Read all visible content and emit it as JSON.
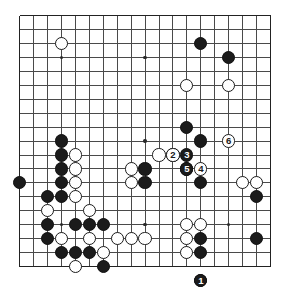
{
  "board": {
    "title": "Go game diagram",
    "size": 19,
    "origin_x": 19.5,
    "origin_y": 15.5,
    "spacing": 13.95,
    "stone_radius": 6.6,
    "grid_color": "#4a4a4a",
    "edge_color": "#222222",
    "black_color": "#1b1b1b",
    "white_color": "#ffffff",
    "background_color": "#ffffff",
    "star_points": [
      [
        3,
        3
      ],
      [
        9,
        3
      ],
      [
        15,
        3
      ],
      [
        3,
        9
      ],
      [
        9,
        9
      ],
      [
        15,
        9
      ],
      [
        3,
        15
      ],
      [
        9,
        15
      ],
      [
        15,
        15
      ]
    ],
    "black_stones": [
      [
        13,
        2
      ],
      [
        15,
        3
      ],
      [
        12,
        8
      ],
      [
        13,
        9
      ],
      [
        3,
        9
      ],
      [
        3,
        10
      ],
      [
        3,
        11
      ],
      [
        3,
        12
      ],
      [
        0,
        12
      ],
      [
        2,
        13
      ],
      [
        3,
        13
      ],
      [
        9,
        11
      ],
      [
        9,
        12
      ],
      [
        12,
        11
      ],
      [
        13,
        12
      ],
      [
        2,
        15
      ],
      [
        4,
        15
      ],
      [
        5,
        15
      ],
      [
        6,
        15
      ],
      [
        2,
        16
      ],
      [
        3,
        17
      ],
      [
        4,
        17
      ],
      [
        5,
        17
      ],
      [
        6,
        18
      ],
      [
        17,
        13
      ],
      [
        13,
        16
      ],
      [
        17,
        16
      ],
      [
        13,
        17
      ],
      [
        13,
        19
      ]
    ],
    "white_stones": [
      [
        3,
        2
      ],
      [
        12,
        5
      ],
      [
        15,
        5
      ],
      [
        10,
        10
      ],
      [
        11,
        10
      ],
      [
        4,
        10
      ],
      [
        4,
        11
      ],
      [
        4,
        12
      ],
      [
        4,
        13
      ],
      [
        2,
        14
      ],
      [
        5,
        14
      ],
      [
        8,
        11
      ],
      [
        8,
        12
      ],
      [
        5,
        16
      ],
      [
        7,
        16
      ],
      [
        8,
        16
      ],
      [
        9,
        16
      ],
      [
        3,
        16
      ],
      [
        4,
        18
      ],
      [
        16,
        12
      ],
      [
        17,
        12
      ],
      [
        12,
        15
      ],
      [
        13,
        15
      ],
      [
        12,
        16
      ],
      [
        12,
        17
      ],
      [
        6,
        17
      ]
    ],
    "move_markers": [
      {
        "number": "1",
        "label": "❶",
        "color": "black",
        "col": 13,
        "row": 19
      },
      {
        "number": "2",
        "label": "2",
        "color": "white",
        "col": 11,
        "row": 10
      },
      {
        "number": "3",
        "label": "3",
        "color": "black",
        "col": 12,
        "row": 10
      },
      {
        "number": "4",
        "label": "4",
        "color": "white",
        "col": 13,
        "row": 11
      },
      {
        "number": "5",
        "label": "5",
        "color": "black",
        "col": 12,
        "row": 11
      },
      {
        "number": "6",
        "label": "6",
        "color": "white",
        "col": 15,
        "row": 9
      }
    ]
  }
}
